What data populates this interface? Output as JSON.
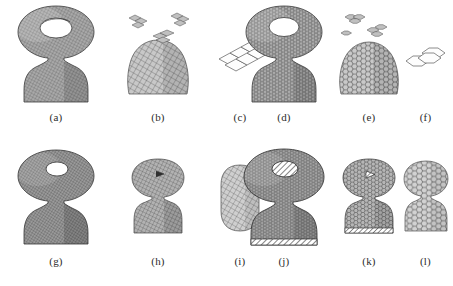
{
  "figure": {
    "caption_labels": [
      "(a)",
      "(b)",
      "(c)",
      "(d)",
      "(e)",
      "(f)",
      "(g)",
      "(h)",
      "(i)",
      "(j)",
      "(k)",
      "(l)"
    ],
    "background_color": "#ffffff",
    "ink_color": "#2b2b2b",
    "grid": {
      "rows": 2,
      "cols": 6
    }
  },
  "panels": [
    {
      "id": "a",
      "label": "(a)",
      "row": 0,
      "col": 0,
      "object": "hourglass-solid",
      "cell_type": "quad",
      "mesh_density": "dense",
      "description": "Dense quadrilateral mesh of a figure-eight / hourglass solid: open torus-like ring on top over a trapezoidal base",
      "shaded": true,
      "fragments": 0
    },
    {
      "id": "b",
      "label": "(b)",
      "row": 0,
      "col": 1,
      "object": "base-block-with-fragments",
      "cell_type": "quad",
      "mesh_density": "coarse",
      "description": "Coarse quadrilateral mesh of the lower block with detached cell clusters floating above",
      "shaded": true,
      "fragments": 3
    },
    {
      "id": "c",
      "label": "(c)",
      "row": 0,
      "col": 2,
      "object": "cell-patch",
      "cell_type": "quad",
      "mesh_density": "wireframe",
      "description": "Single wireframe patch of six quadrilateral (diamond) cells",
      "shaded": false,
      "fragments": 0,
      "cell_count": 6
    },
    {
      "id": "d",
      "label": "(d)",
      "row": 0,
      "col": 3,
      "object": "hourglass-solid",
      "cell_type": "hex",
      "mesh_density": "dense",
      "description": "Dense hexagonal mesh of the same figure-eight / hourglass solid",
      "shaded": true,
      "fragments": 0
    },
    {
      "id": "e",
      "label": "(e)",
      "row": 0,
      "col": 4,
      "object": "base-block-with-fragments",
      "cell_type": "hex",
      "mesh_density": "coarse",
      "description": "Coarse hexagonal mesh of the lower block with detached hexagonal cell clusters floating above",
      "shaded": true,
      "fragments": 3
    },
    {
      "id": "f",
      "label": "(f)",
      "row": 0,
      "col": 5,
      "object": "cell-patch",
      "cell_type": "hex",
      "mesh_density": "wireframe",
      "description": "Single wireframe patch of three hexagonal cells",
      "shaded": false,
      "fragments": 0,
      "cell_count": 3
    },
    {
      "id": "g",
      "label": "(g)",
      "row": 1,
      "col": 0,
      "object": "hourglass-solid",
      "cell_type": "quad",
      "mesh_density": "dense",
      "description": "Dense quadrilateral mesh hourglass, darker shading, small top aperture",
      "shaded": true,
      "fragments": 0
    },
    {
      "id": "h",
      "label": "(h)",
      "row": 1,
      "col": 1,
      "object": "hourglass-solid",
      "cell_type": "quad",
      "mesh_density": "mid",
      "description": "Medium-resolution quadrilateral mesh hourglass, smaller scale",
      "shaded": true,
      "fragments": 0
    },
    {
      "id": "i",
      "label": "(i)",
      "row": 1,
      "col": 2,
      "object": "block-rounded",
      "cell_type": "quad",
      "mesh_density": "coarse",
      "description": "Coarse quadrilateral mesh of a rounded block, lightest shading",
      "shaded": true,
      "fragments": 0
    },
    {
      "id": "j",
      "label": "(j)",
      "row": 1,
      "col": 3,
      "object": "hourglass-solid",
      "cell_type": "hex",
      "mesh_density": "dense",
      "description": "Dense hexagonal mesh hourglass with hatched bottom edge and hatched top aperture",
      "shaded": true,
      "fragments": 0
    },
    {
      "id": "k",
      "label": "(k)",
      "row": 1,
      "col": 4,
      "object": "hourglass-solid",
      "cell_type": "hex",
      "mesh_density": "mid",
      "description": "Medium-resolution hexagonal mesh hourglass, smaller scale",
      "shaded": true,
      "fragments": 0
    },
    {
      "id": "l",
      "label": "(l)",
      "row": 1,
      "col": 5,
      "object": "hourglass-solid",
      "cell_type": "hex",
      "mesh_density": "coarse",
      "description": "Coarse hexagonal mesh hourglass, lightest shading, large visible cells",
      "shaded": true,
      "fragments": 0
    }
  ]
}
